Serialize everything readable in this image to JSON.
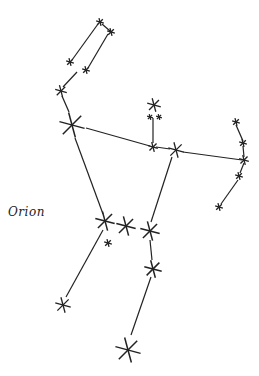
{
  "title": "Orion",
  "colors": {
    "ink": "#222222",
    "background": "#ffffff"
  },
  "stars": [
    {
      "id": "club-top-left",
      "x": 100,
      "y": 22,
      "size": 4
    },
    {
      "id": "club-top-right",
      "x": 111,
      "y": 32,
      "size": 4
    },
    {
      "id": "club-arm-left-end",
      "x": 70,
      "y": 62,
      "size": 4
    },
    {
      "id": "club-arm-right-end",
      "x": 86,
      "y": 70,
      "size": 4
    },
    {
      "id": "arm-star",
      "x": 61,
      "y": 91,
      "size": 6
    },
    {
      "id": "betelgeuse",
      "x": 72,
      "y": 125,
      "size": 13
    },
    {
      "id": "meissa-head",
      "x": 154,
      "y": 105,
      "size": 7
    },
    {
      "id": "head-pair-left",
      "x": 150,
      "y": 117,
      "size": 3
    },
    {
      "id": "head-pair-right",
      "x": 159,
      "y": 117,
      "size": 3
    },
    {
      "id": "shoulder-mid",
      "x": 153,
      "y": 147,
      "size": 5
    },
    {
      "id": "bellatrix",
      "x": 176,
      "y": 150,
      "size": 8
    },
    {
      "id": "shield-1",
      "x": 236,
      "y": 122,
      "size": 4
    },
    {
      "id": "shield-2",
      "x": 243,
      "y": 143,
      "size": 4
    },
    {
      "id": "shield-3",
      "x": 244,
      "y": 160,
      "size": 5
    },
    {
      "id": "shield-4",
      "x": 239,
      "y": 176,
      "size": 4
    },
    {
      "id": "shield-5",
      "x": 219,
      "y": 207,
      "size": 4
    },
    {
      "id": "alnitak",
      "x": 105,
      "y": 221,
      "size": 10
    },
    {
      "id": "alnilam",
      "x": 126,
      "y": 226,
      "size": 10
    },
    {
      "id": "mintaka",
      "x": 150,
      "y": 231,
      "size": 10
    },
    {
      "id": "sword-star",
      "x": 108,
      "y": 243,
      "size": 4
    },
    {
      "id": "knee-star",
      "x": 153,
      "y": 269,
      "size": 9
    },
    {
      "id": "saiph",
      "x": 63,
      "y": 305,
      "size": 8
    },
    {
      "id": "rigel",
      "x": 128,
      "y": 350,
      "size": 13
    }
  ],
  "lines": [
    [
      98,
      24,
      72,
      60
    ],
    [
      102,
      24,
      110,
      31
    ],
    [
      108,
      34,
      88,
      68
    ],
    [
      77,
      72,
      63,
      87
    ],
    [
      62,
      96,
      69,
      112
    ],
    [
      86,
      128,
      150,
      146
    ],
    [
      156,
      147,
      170,
      149
    ],
    [
      183,
      152,
      242,
      160
    ],
    [
      153,
      118,
      153,
      143
    ],
    [
      75,
      138,
      103,
      214
    ],
    [
      172,
      157,
      151,
      222
    ],
    [
      150,
      240,
      152,
      260
    ],
    [
      151,
      277,
      131,
      335
    ],
    [
      103,
      230,
      66,
      297
    ],
    [
      236,
      125,
      243,
      141
    ],
    [
      243,
      146,
      244,
      157
    ],
    [
      244,
      163,
      240,
      173
    ],
    [
      238,
      180,
      221,
      204
    ]
  ]
}
